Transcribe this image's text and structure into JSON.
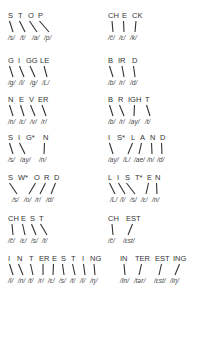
{
  "diagram": {
    "type": "grapheme-phoneme correspondence chart",
    "entries": [
      {
        "word": "STOP",
        "x": 8,
        "y": 10,
        "letters": [
          {
            "t": "S",
            "x": 0,
            "px": 0,
            "p": "/s/"
          },
          {
            "t": "T",
            "x": 10,
            "px": 12,
            "p": "/t/"
          },
          {
            "t": "O",
            "x": 20,
            "px": 24,
            "p": "/a/"
          },
          {
            "t": "P",
            "x": 30,
            "px": 36,
            "p": "/p/"
          }
        ]
      },
      {
        "word": "CHECK",
        "x": 108,
        "y": 10,
        "letters": [
          {
            "t": "CH",
            "x": 0,
            "px": 0,
            "p": "/č/"
          },
          {
            "t": "E",
            "x": 14,
            "px": 11,
            "p": "/ɛ/"
          },
          {
            "t": "CK",
            "x": 24,
            "px": 22,
            "p": "/k/"
          }
        ]
      },
      {
        "word": "GIGGLE",
        "x": 8,
        "y": 55,
        "letters": [
          {
            "t": "G",
            "x": 0,
            "px": 0,
            "p": "/g/"
          },
          {
            "t": "I",
            "x": 10,
            "px": 11,
            "p": "/I/"
          },
          {
            "t": "GG",
            "x": 18,
            "px": 22,
            "p": "/g/"
          },
          {
            "t": "LE",
            "x": 32,
            "px": 34,
            "p": "/L/"
          }
        ]
      },
      {
        "word": "BIRD",
        "x": 108,
        "y": 55,
        "letters": [
          {
            "t": "B",
            "x": 0,
            "px": 0,
            "p": "/b/"
          },
          {
            "t": "IR",
            "x": 10,
            "px": 11,
            "p": "/r/"
          },
          {
            "t": "D",
            "x": 24,
            "px": 22,
            "p": "/d/"
          }
        ]
      },
      {
        "word": "NEVER",
        "x": 8,
        "y": 94,
        "letters": [
          {
            "t": "N",
            "x": 0,
            "px": 0,
            "p": "/n/"
          },
          {
            "t": "E",
            "x": 11,
            "px": 11,
            "p": "/ɛ/"
          },
          {
            "t": "V",
            "x": 21,
            "px": 22,
            "p": "/v/"
          },
          {
            "t": "ER",
            "x": 30,
            "px": 33,
            "p": "/r/"
          }
        ]
      },
      {
        "word": "BRIGHT",
        "x": 108,
        "y": 94,
        "letters": [
          {
            "t": "B",
            "x": 0,
            "px": 0,
            "p": "/b/"
          },
          {
            "t": "R",
            "x": 10,
            "px": 11,
            "p": "/r/"
          },
          {
            "t": "IGH",
            "x": 20,
            "px": 21,
            "p": "/ay/"
          },
          {
            "t": "T",
            "x": 37,
            "px": 37,
            "p": "/t/"
          }
        ]
      },
      {
        "word": "SIG*N",
        "x": 8,
        "y": 132,
        "letters": [
          {
            "t": "S",
            "x": 0,
            "px": 0,
            "p": "/s/"
          },
          {
            "t": "I",
            "x": 10,
            "px": 12,
            "p": "/ay/"
          },
          {
            "t": "G*",
            "x": 18,
            "px": 12,
            "p": ""
          },
          {
            "t": "N",
            "x": 35,
            "px": 31,
            "p": "/n/"
          }
        ]
      },
      {
        "word": "IS*LAND",
        "x": 108,
        "y": 132,
        "letters": [
          {
            "t": "I",
            "x": 0,
            "px": 0,
            "p": "/ay/"
          },
          {
            "t": "S*",
            "x": 9,
            "px": 0,
            "p": ""
          },
          {
            "t": "L",
            "x": 23,
            "px": 15,
            "p": "/L/"
          },
          {
            "t": "A",
            "x": 32,
            "px": 26,
            "p": "/ae/"
          },
          {
            "t": "N",
            "x": 42,
            "px": 39,
            "p": "/n/"
          },
          {
            "t": "D",
            "x": 52,
            "px": 49,
            "p": "/d/"
          }
        ]
      },
      {
        "word": "SW*ORD",
        "x": 8,
        "y": 172,
        "letters": [
          {
            "t": "S",
            "x": 0,
            "px": 4,
            "p": "/s/"
          },
          {
            "t": "W*",
            "x": 10,
            "px": 4,
            "p": ""
          },
          {
            "t": "O",
            "x": 26,
            "px": 16,
            "p": "/o/"
          },
          {
            "t": "R",
            "x": 36,
            "px": 27,
            "p": "/r/"
          },
          {
            "t": "D",
            "x": 46,
            "px": 38,
            "p": "/d/"
          }
        ]
      },
      {
        "word": "LIST*EN",
        "x": 108,
        "y": 172,
        "letters": [
          {
            "t": "L",
            "x": 0,
            "px": 2,
            "p": "/L/"
          },
          {
            "t": "I",
            "x": 9,
            "px": 12,
            "p": "/I/"
          },
          {
            "t": "S",
            "x": 17,
            "px": 22,
            "p": "/s/"
          },
          {
            "t": "T*",
            "x": 27,
            "px": 22,
            "p": ""
          },
          {
            "t": "E",
            "x": 39,
            "px": 33,
            "p": "/ɛ/"
          },
          {
            "t": "N",
            "x": 47,
            "px": 44,
            "p": "/n/"
          }
        ]
      },
      {
        "word": "CHEST",
        "x": 8,
        "y": 213,
        "letters": [
          {
            "t": "CH",
            "x": 0,
            "px": 0,
            "p": "/č/"
          },
          {
            "t": "E",
            "x": 13,
            "px": 12,
            "p": "/ɛ/"
          },
          {
            "t": "S",
            "x": 22,
            "px": 23,
            "p": "/s/"
          },
          {
            "t": "T",
            "x": 31,
            "px": 34,
            "p": "/t/"
          }
        ]
      },
      {
        "word": "CH EST",
        "x": 108,
        "y": 213,
        "letters": [
          {
            "t": "CH",
            "x": 0,
            "px": 0,
            "p": "/č/"
          },
          {
            "t": "EST",
            "x": 18,
            "px": 15,
            "p": "/ɛst/"
          }
        ]
      },
      {
        "word": "INTERESTING",
        "x": 8,
        "y": 253,
        "letters": [
          {
            "t": "I",
            "x": 0,
            "px": 0,
            "p": "/I/"
          },
          {
            "t": "N",
            "x": 9,
            "px": 10,
            "p": "/n/"
          },
          {
            "t": "T",
            "x": 21,
            "px": 20,
            "p": "/t/"
          },
          {
            "t": "ER",
            "x": 31,
            "px": 30,
            "p": "/r/"
          },
          {
            "t": "E",
            "x": 44,
            "px": 40,
            "p": "/ɛ/"
          },
          {
            "t": "S",
            "x": 53,
            "px": 51,
            "p": "/s/"
          },
          {
            "t": "T",
            "x": 63,
            "px": 62,
            "p": "/t/"
          },
          {
            "t": "I",
            "x": 74,
            "px": 72,
            "p": "/I/"
          },
          {
            "t": "NG",
            "x": 82,
            "px": 82,
            "p": "/ŋ/"
          }
        ]
      },
      {
        "word": "IN TER EST ING",
        "x": 120,
        "y": 253,
        "letters": [
          {
            "t": "IN",
            "x": 0,
            "px": 0,
            "p": "/In/"
          },
          {
            "t": "TER",
            "x": 15,
            "px": 14,
            "p": "/tər/"
          },
          {
            "t": "EST",
            "x": 35,
            "px": 34,
            "p": "/ɛst/"
          },
          {
            "t": "ING",
            "x": 53,
            "px": 50,
            "p": "/Iŋ/"
          }
        ]
      }
    ],
    "colors": {
      "ink": "#333333",
      "background": "#ffffff"
    }
  }
}
